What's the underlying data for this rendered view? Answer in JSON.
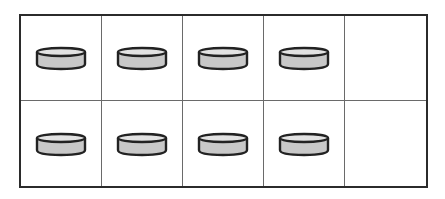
{
  "diagram": {
    "type": "ten-frame",
    "rows": 2,
    "columns": 5,
    "filled_count": 8,
    "empty_count": 2,
    "cells": [
      {
        "row": 1,
        "col": 1,
        "filled": true
      },
      {
        "row": 1,
        "col": 2,
        "filled": true
      },
      {
        "row": 1,
        "col": 3,
        "filled": true
      },
      {
        "row": 1,
        "col": 4,
        "filled": true
      },
      {
        "row": 1,
        "col": 5,
        "filled": false
      },
      {
        "row": 2,
        "col": 1,
        "filled": true
      },
      {
        "row": 2,
        "col": 2,
        "filled": true
      },
      {
        "row": 2,
        "col": 3,
        "filled": true
      },
      {
        "row": 2,
        "col": 4,
        "filled": true
      },
      {
        "row": 2,
        "col": 5,
        "filled": false
      }
    ],
    "colors": {
      "frame_border": "#2b2b2b",
      "grid_line": "#6a6a6a",
      "counter_fill": "#c8c8c8",
      "counter_top": "#e2e2e2",
      "counter_stroke": "#222222"
    }
  }
}
